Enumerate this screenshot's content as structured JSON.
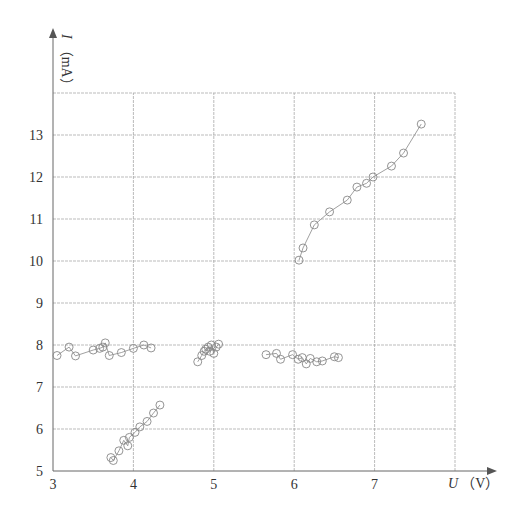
{
  "chart_data": {
    "type": "scatter",
    "title": "",
    "xlabel": "U（V）",
    "ylabel": "I（mA）",
    "xlabel_var": "U",
    "xlabel_unit": "（V）",
    "ylabel_var": "I",
    "ylabel_unit": "（mA）",
    "xlim": [
      3,
      8
    ],
    "ylim": [
      5,
      14
    ],
    "xticks": [
      3,
      4,
      5,
      6,
      7
    ],
    "yticks": [
      5,
      6,
      7,
      8,
      9,
      10,
      11,
      12,
      13
    ],
    "grid": true,
    "legend": null,
    "marker": "open-circle",
    "series": [
      {
        "name": "high-branch",
        "connected": true,
        "x": [
          6.06,
          6.11,
          6.25,
          6.44,
          6.66,
          6.78,
          6.9,
          6.98,
          7.21,
          7.36,
          7.58
        ],
        "y": [
          10.02,
          10.31,
          10.86,
          11.17,
          11.45,
          11.76,
          11.85,
          12.0,
          12.26,
          12.57,
          13.26
        ]
      },
      {
        "name": "mid-branch-left",
        "connected": true,
        "x": [
          3.05,
          3.2,
          3.28,
          3.5,
          3.58,
          3.62,
          3.65,
          3.7,
          3.85,
          4.0,
          4.13,
          4.22
        ],
        "y": [
          7.75,
          7.95,
          7.74,
          7.88,
          7.92,
          7.95,
          8.05,
          7.75,
          7.82,
          7.92,
          8.0,
          7.93
        ]
      },
      {
        "name": "mid-branch-center",
        "connected": true,
        "x": [
          4.8,
          4.85,
          4.88,
          4.9,
          4.93,
          4.95,
          4.97,
          5.0,
          5.03,
          5.06
        ],
        "y": [
          7.6,
          7.75,
          7.85,
          7.9,
          7.95,
          7.85,
          8.0,
          7.8,
          7.95,
          8.02
        ]
      },
      {
        "name": "mid-branch-right",
        "connected": true,
        "x": [
          5.65,
          5.78,
          5.83,
          5.98,
          6.05,
          6.1,
          6.15,
          6.2,
          6.28,
          6.35,
          6.5,
          6.55
        ],
        "y": [
          7.77,
          7.8,
          7.66,
          7.77,
          7.66,
          7.7,
          7.55,
          7.68,
          7.6,
          7.62,
          7.72,
          7.7
        ]
      },
      {
        "name": "low-branch",
        "connected": true,
        "x": [
          3.72,
          3.75,
          3.82,
          3.88,
          3.93,
          3.95,
          4.02,
          4.08,
          4.17,
          4.25,
          4.33
        ],
        "y": [
          5.32,
          5.25,
          5.48,
          5.73,
          5.6,
          5.8,
          5.92,
          6.05,
          6.18,
          6.38,
          6.57
        ]
      }
    ]
  }
}
